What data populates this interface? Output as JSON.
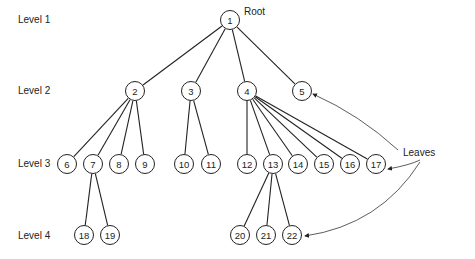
{
  "levels": [
    {
      "label": "Level 1",
      "x": 18,
      "y": 20
    },
    {
      "label": "Level 2",
      "x": 18,
      "y": 91
    },
    {
      "label": "Level 3",
      "x": 18,
      "y": 164
    },
    {
      "label": "Level 4",
      "x": 18,
      "y": 236
    }
  ],
  "annotations": {
    "root_label": "Root",
    "leaves_label": "Leaves"
  },
  "nodes": [
    {
      "id": "1",
      "x": 230,
      "y": 20
    },
    {
      "id": "2",
      "x": 135,
      "y": 91
    },
    {
      "id": "3",
      "x": 191,
      "y": 91
    },
    {
      "id": "4",
      "x": 247,
      "y": 91
    },
    {
      "id": "5",
      "x": 302,
      "y": 91
    },
    {
      "id": "6",
      "x": 67,
      "y": 164
    },
    {
      "id": "7",
      "x": 93,
      "y": 164
    },
    {
      "id": "8",
      "x": 119,
      "y": 164
    },
    {
      "id": "9",
      "x": 145,
      "y": 164
    },
    {
      "id": "10",
      "x": 184,
      "y": 164
    },
    {
      "id": "11",
      "x": 211,
      "y": 164
    },
    {
      "id": "12",
      "x": 247,
      "y": 164
    },
    {
      "id": "13",
      "x": 273,
      "y": 164
    },
    {
      "id": "14",
      "x": 298,
      "y": 164
    },
    {
      "id": "15",
      "x": 324,
      "y": 164
    },
    {
      "id": "16",
      "x": 350,
      "y": 164
    },
    {
      "id": "17",
      "x": 376,
      "y": 164
    },
    {
      "id": "18",
      "x": 84,
      "y": 235
    },
    {
      "id": "19",
      "x": 110,
      "y": 235
    },
    {
      "id": "20",
      "x": 240,
      "y": 235
    },
    {
      "id": "21",
      "x": 266,
      "y": 235
    },
    {
      "id": "22",
      "x": 292,
      "y": 235
    }
  ],
  "edges": [
    [
      "1",
      "2"
    ],
    [
      "1",
      "3"
    ],
    [
      "1",
      "4"
    ],
    [
      "1",
      "5"
    ],
    [
      "2",
      "6"
    ],
    [
      "2",
      "7"
    ],
    [
      "2",
      "8"
    ],
    [
      "2",
      "9"
    ],
    [
      "3",
      "10"
    ],
    [
      "3",
      "11"
    ],
    [
      "4",
      "12"
    ],
    [
      "4",
      "13"
    ],
    [
      "4",
      "14"
    ],
    [
      "4",
      "15"
    ],
    [
      "4",
      "16"
    ],
    [
      "4",
      "17"
    ],
    [
      "7",
      "18"
    ],
    [
      "7",
      "19"
    ],
    [
      "13",
      "20"
    ],
    [
      "13",
      "21"
    ],
    [
      "13",
      "22"
    ]
  ]
}
